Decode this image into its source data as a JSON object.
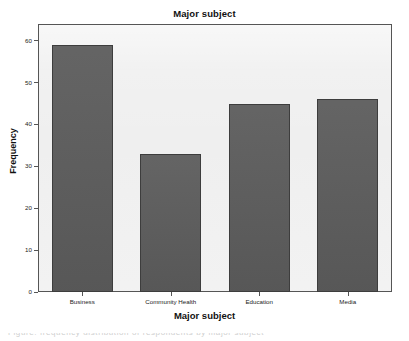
{
  "chart_data": {
    "type": "bar",
    "title": "Major subject",
    "xlabel": "Major subject",
    "ylabel": "Frequency",
    "categories": [
      "Business",
      "Community Health",
      "Education",
      "Media"
    ],
    "values": [
      59,
      33,
      45,
      46
    ],
    "yticks": [
      0,
      10,
      20,
      30,
      40,
      50,
      60
    ],
    "ytick_labels": [
      "0",
      "10",
      "20",
      "30",
      "40",
      "50",
      "60"
    ],
    "ylim": [
      0,
      64
    ],
    "grid": false,
    "legend": null,
    "bar_color": "#5c5c5c",
    "bar_edge_color": "#3d3d3d",
    "plot_background": "#efefef",
    "figure_background": "#ffffff",
    "axis_color": "#555555"
  },
  "caption_sliver": {
    "text": "Figure: frequency distribution of respondents by major subject"
  }
}
